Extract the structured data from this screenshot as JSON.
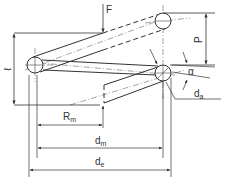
{
  "diagram": {
    "colors": {
      "line": "#333333",
      "background": "#ffffff"
    },
    "labels": {
      "force": "F",
      "length": "ℓ",
      "pitch": "P",
      "helix_angle": "α",
      "wire_diameter": {
        "base": "d",
        "sub": "a"
      },
      "mean_radius": {
        "base": "R",
        "sub": "m"
      },
      "mean_diameter": {
        "base": "d",
        "sub": "m"
      },
      "outer_diameter": {
        "base": "d",
        "sub": "e"
      }
    }
  }
}
